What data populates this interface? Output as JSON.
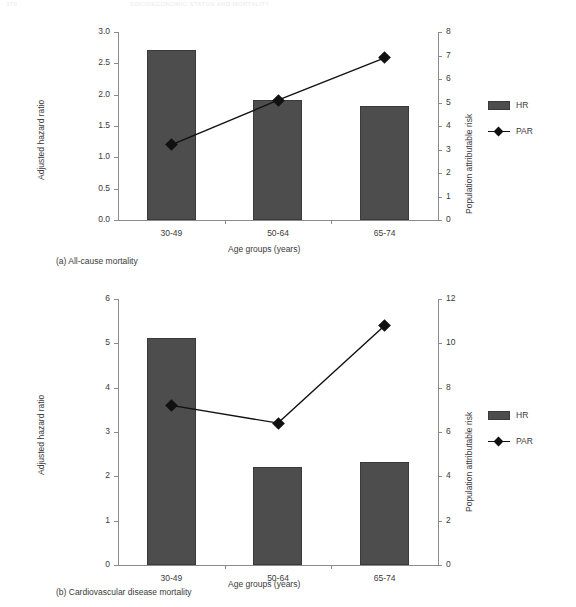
{
  "running_head": {
    "left": "370",
    "right": "SOCIOECONOMIC STATUS AND MORTALITY"
  },
  "legend": {
    "hr_label": "HR",
    "par_label": "PAR",
    "bar_color": "#4d4d4d",
    "line_color": "#111111"
  },
  "captions": {
    "a": "(a) All-cause mortality",
    "b": "(b) Cardiovascular disease mortality"
  },
  "chart_data": [
    {
      "type": "bar",
      "id": "panel-a",
      "title": "(a) All-cause mortality",
      "categories": [
        "30-49",
        "50-64",
        "65-74"
      ],
      "xlabel": "Age groups (years)",
      "ylabel": "Adjusted hazard ratio",
      "y2label": "Population attributable risk",
      "ylim": [
        0,
        3
      ],
      "yticks": [
        "0.0",
        "0.5",
        "1.0",
        "1.5",
        "2.0",
        "2.5",
        "3.0"
      ],
      "y2lim": [
        0,
        8
      ],
      "y2ticks": [
        "0",
        "1",
        "2",
        "3",
        "4",
        "5",
        "6",
        "7",
        "8"
      ],
      "grid": false,
      "legend_position": "right",
      "series": [
        {
          "name": "HR",
          "kind": "bar",
          "axis": "left",
          "values": [
            2.71,
            1.92,
            1.82
          ]
        },
        {
          "name": "PAR",
          "kind": "line",
          "axis": "right",
          "values": [
            3.2,
            5.1,
            6.9
          ]
        }
      ]
    },
    {
      "type": "bar",
      "id": "panel-b",
      "title": "(b) Cardiovascular disease mortality",
      "categories": [
        "30-49",
        "50-64",
        "65-74"
      ],
      "xlabel": "Age groups (years)",
      "ylabel": "Adjusted hazard ratio",
      "y2label": "Population attributable risk",
      "ylim": [
        0,
        6
      ],
      "yticks": [
        "0",
        "1",
        "2",
        "3",
        "4",
        "5",
        "6"
      ],
      "y2lim": [
        0,
        12
      ],
      "y2ticks": [
        "0",
        "2",
        "4",
        "6",
        "8",
        "10",
        "12"
      ],
      "grid": false,
      "legend_position": "right",
      "series": [
        {
          "name": "HR",
          "kind": "bar",
          "axis": "left",
          "values": [
            5.12,
            2.22,
            2.32
          ]
        },
        {
          "name": "PAR",
          "kind": "line",
          "axis": "right",
          "values": [
            7.2,
            6.4,
            10.8
          ]
        }
      ]
    }
  ]
}
